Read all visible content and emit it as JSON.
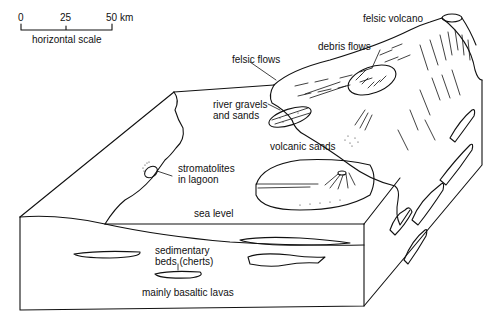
{
  "scale_bar": {
    "ticks": [
      "0",
      "25",
      "50 km"
    ],
    "label": "horizontal scale"
  },
  "labels": {
    "felsic_volcano": "felsic volcano",
    "felsic_flows": "felsic flows",
    "debris_flows": "debris flows",
    "river_gravels_line1": "river gravels",
    "river_gravels_line2": "and sands",
    "volcanic_sands": "volcanic sands",
    "stromatolites_line1": "stromatolites",
    "stromatolites_line2": "in lagoon",
    "sea_level": "sea level",
    "sedimentary_line1": "sedimentary",
    "sedimentary_line2": "beds (cherts)",
    "basaltic_lavas": "mainly basaltic lavas"
  },
  "colors": {
    "line": "#111111",
    "background": "#ffffff"
  }
}
